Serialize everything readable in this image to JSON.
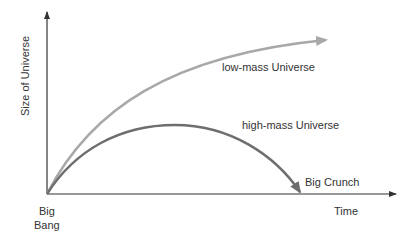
{
  "diagram": {
    "y_axis_label": "Size of Universe",
    "x_axis_label": "Time",
    "origin_label_line1": "Big",
    "origin_label_line2": "Bang",
    "curves": [
      {
        "name": "low-mass Universe",
        "color": "#a8a8a8",
        "ends_with": "arrow continuing upward"
      },
      {
        "name": "high-mass Universe",
        "color": "#6e6e6e",
        "ends_with": "Big Crunch"
      }
    ],
    "end_label": "Big Crunch",
    "axis_color": "#333333"
  }
}
